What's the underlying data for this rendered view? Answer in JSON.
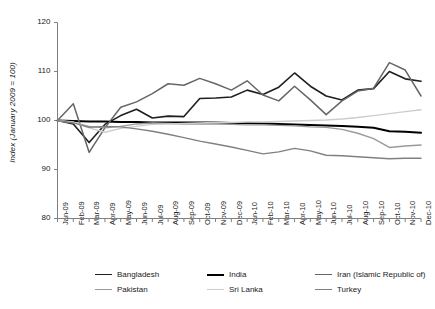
{
  "chart_data": {
    "type": "line",
    "title": "",
    "subtitle": "",
    "xlabel": "",
    "ylabel": "Index (January 2009 = 100)",
    "ylim": [
      80,
      120
    ],
    "yticks": [
      80,
      90,
      100,
      110,
      120
    ],
    "grid": false,
    "legend_position": "bottom",
    "categories": [
      "Jan-09",
      "Feb-09",
      "Mar-09",
      "Apr-09",
      "May-09",
      "Jun-09",
      "Jul-09",
      "Aug-09",
      "Sep-09",
      "Oct-09",
      "Nov-09",
      "Dec-09",
      "Jan-10",
      "Feb-10",
      "Mar-10",
      "Apr-10",
      "May-10",
      "Jun-10",
      "Jul-10",
      "Aug-10",
      "Sep-10",
      "Oct-10",
      "Nov-10",
      "Dec-10"
    ],
    "series": [
      {
        "name": "Bangladesh",
        "color": "#1f1f1f",
        "width": 1.6,
        "values": [
          100.0,
          99.3,
          95.5,
          99.2,
          101.0,
          102.3,
          100.5,
          100.9,
          100.8,
          104.5,
          104.6,
          104.8,
          106.2,
          105.3,
          106.8,
          109.7,
          107.0,
          105.0,
          104.2,
          106.2,
          106.5,
          110.0,
          108.5,
          108.0
        ]
      },
      {
        "name": "India",
        "color": "#000000",
        "width": 2.0,
        "values": [
          100.0,
          99.9,
          99.8,
          99.8,
          99.7,
          99.7,
          99.6,
          99.6,
          99.6,
          99.6,
          99.6,
          99.5,
          99.5,
          99.4,
          99.3,
          99.2,
          99.1,
          99.0,
          98.9,
          98.7,
          98.5,
          97.8,
          97.7,
          97.5
        ]
      },
      {
        "name": "Iran (Islamic Republic of)",
        "color": "#666666",
        "width": 1.5,
        "values": [
          100.0,
          103.4,
          93.5,
          98.5,
          102.7,
          103.8,
          105.5,
          107.5,
          107.2,
          108.6,
          107.5,
          106.2,
          108.1,
          105.2,
          104.0,
          107.0,
          104.2,
          101.2,
          104.0,
          106.0,
          106.6,
          111.8,
          110.3,
          105.0
        ]
      },
      {
        "name": "Pakistan",
        "color": "#9a9a9a",
        "width": 1.4,
        "values": [
          100.0,
          99.6,
          98.8,
          98.5,
          98.8,
          99.3,
          99.5,
          99.4,
          99.3,
          99.3,
          99.3,
          99.2,
          99.1,
          99.1,
          99.0,
          98.9,
          98.7,
          98.6,
          98.2,
          97.4,
          96.3,
          94.5,
          94.8,
          95.0
        ]
      },
      {
        "name": "Sri Lanka",
        "color": "#cccccc",
        "width": 1.4,
        "values": [
          100.0,
          99.7,
          98.5,
          97.6,
          98.4,
          98.8,
          99.2,
          99.3,
          99.4,
          99.5,
          99.6,
          99.6,
          99.7,
          99.7,
          99.8,
          99.9,
          100.0,
          100.1,
          100.3,
          100.6,
          101.0,
          101.4,
          101.8,
          102.2
        ]
      },
      {
        "name": "Turkey",
        "color": "#808080",
        "width": 1.4,
        "values": [
          100.0,
          99.5,
          98.6,
          98.8,
          98.7,
          98.3,
          97.8,
          97.2,
          96.5,
          95.8,
          95.2,
          94.6,
          93.9,
          93.2,
          93.6,
          94.3,
          93.8,
          92.9,
          92.8,
          92.6,
          92.4,
          92.2,
          92.3,
          92.3
        ]
      }
    ]
  },
  "axis": {
    "ylabel_text": "Index (January 2009 = 100)",
    "ytick_labels": [
      "120",
      "110",
      "100",
      "90",
      "80"
    ],
    "axis_color": "#808080"
  },
  "legend": {
    "items": [
      {
        "label": "Bangladesh",
        "color": "#1f1f1f",
        "width": "1.6px"
      },
      {
        "label": "India",
        "color": "#000000",
        "width": "2px"
      },
      {
        "label": "Iran (Islamic Republic of)",
        "color": "#666666",
        "width": "1.5px"
      },
      {
        "label": "Pakistan",
        "color": "#9a9a9a",
        "width": "1.4px"
      },
      {
        "label": "Sri Lanka",
        "color": "#cccccc",
        "width": "1.6px"
      },
      {
        "label": "Turkey",
        "color": "#808080",
        "width": "1.4px"
      }
    ]
  }
}
